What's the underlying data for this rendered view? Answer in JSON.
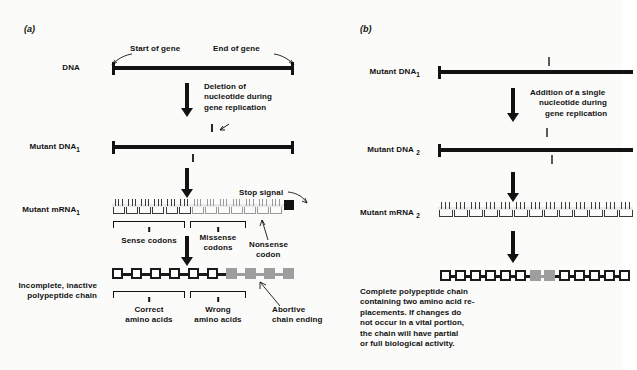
{
  "figure": {
    "type": "biology-diagram",
    "topic": "Frameshift mutations: deletion versus addition of a nucleotide"
  },
  "panel_a": {
    "tag": "(a)",
    "rows": {
      "dna_label": "DNA",
      "mutant_dna_label": "Mutant DNA",
      "mutant_dna_sub": "1",
      "mutant_mrna_label": "Mutant mRNA",
      "mutant_mrna_sub": "1",
      "polypeptide_label_line1": "Incomplete, inactive",
      "polypeptide_label_line2": "polypeptide chain"
    },
    "callouts": {
      "start_of_gene": "Start of gene",
      "end_of_gene": "End of gene",
      "stop_signal": "Stop signal",
      "nonsense_codon_line1": "Nonsense",
      "nonsense_codon_line2": "codon",
      "abortive_line1": "Abortive",
      "abortive_line2": "chain ending"
    },
    "process_text": {
      "line1": "Deletion of",
      "line2": "nucleotide  during",
      "line3": "gene replication"
    },
    "brackets": {
      "sense_codons": "Sense codons",
      "missense_codons_line1": "Missense",
      "missense_codons_line2": "codons",
      "correct_line1": "Correct",
      "correct_line2": "amino acids",
      "wrong_line1": "Wrong",
      "wrong_line2": "amino acids"
    },
    "chain_data": {
      "total_residues": 10,
      "correct_residues": 6,
      "wrong_residues": 4,
      "terminated_early": true
    },
    "mrna_data": {
      "total_codons": 13,
      "sense_codons": 6,
      "missense_codons": 6,
      "nonsense_codon": 1,
      "stop_signal_present": true
    }
  },
  "panel_b": {
    "tag": "(b)",
    "rows": {
      "mutant_dna1_label": "Mutant DNA",
      "mutant_dna1_sub": "1",
      "mutant_dna2_label": "Mutant DNA",
      "mutant_dna2_sub": "2",
      "mutant_mrna2_label": "Mutant mRNA",
      "mutant_mrna2_sub": "2"
    },
    "process_text": {
      "line1": "Addition of a single",
      "line2": "nucleotide  during",
      "line3": "gene replication"
    },
    "caption": {
      "line1": "Complete polypeptide chain",
      "line2": "containing two amino acid re-",
      "line3": "placements.  If changes do",
      "line4": "not occur in a vital portion,",
      "line5": "the chain will have partial",
      "line6": "or full biological activity."
    },
    "chain_data": {
      "total_residues": 13,
      "white_before": 6,
      "gray_residues": 2,
      "white_after": 5,
      "terminated_early": false
    },
    "mrna_data": {
      "total_codons": 13,
      "stop_signal_present": false
    }
  },
  "colors": {
    "ink": "#121212",
    "gray_residue": "#9e9e9e",
    "light_strand": "#9a9a9a",
    "paper": "#fbfbfa"
  }
}
